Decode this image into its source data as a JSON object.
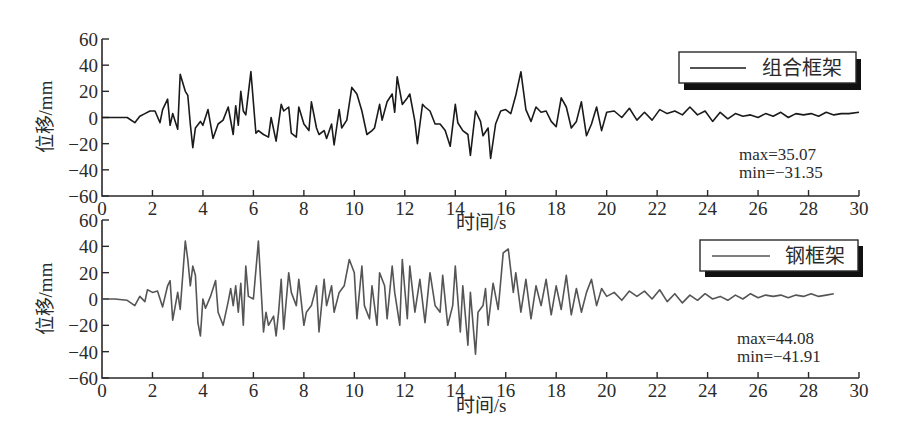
{
  "chart_data": [
    {
      "type": "line",
      "title": "",
      "xlabel": "时间/s",
      "ylabel": "位移/mm",
      "xlim": [
        0,
        30
      ],
      "ylim": [
        -60,
        60
      ],
      "xticks": [
        0,
        2,
        4,
        6,
        8,
        10,
        12,
        14,
        16,
        18,
        20,
        22,
        24,
        26,
        28,
        30
      ],
      "yticks": [
        -60,
        -40,
        -20,
        0,
        20,
        40,
        60
      ],
      "grid": false,
      "legend": {
        "position": "upper right",
        "entries": [
          "组合框架"
        ]
      },
      "color": "#1a1a1a",
      "annotations": [
        "max=35.07",
        "min=-31.35"
      ],
      "series": [
        {
          "name": "组合框架",
          "x": [
            0,
            0.5,
            1.0,
            1.3,
            1.5,
            1.7,
            1.9,
            2.1,
            2.3,
            2.4,
            2.6,
            2.7,
            2.8,
            3.0,
            3.1,
            3.3,
            3.4,
            3.5,
            3.6,
            3.7,
            3.9,
            4.0,
            4.2,
            4.4,
            4.6,
            4.8,
            5.0,
            5.2,
            5.3,
            5.4,
            5.5,
            5.6,
            5.7,
            5.9,
            6.1,
            6.2,
            6.4,
            6.6,
            6.7,
            6.9,
            7.1,
            7.2,
            7.4,
            7.5,
            7.7,
            7.8,
            8.0,
            8.2,
            8.3,
            8.5,
            8.6,
            8.8,
            8.9,
            9.1,
            9.2,
            9.4,
            9.5,
            9.7,
            9.9,
            10.1,
            10.3,
            10.5,
            10.7,
            10.8,
            11.0,
            11.1,
            11.3,
            11.5,
            11.6,
            11.7,
            11.9,
            12.1,
            12.2,
            12.4,
            12.5,
            12.7,
            12.8,
            13.0,
            13.2,
            13.4,
            13.6,
            13.8,
            14.0,
            14.1,
            14.3,
            14.5,
            14.6,
            14.8,
            15.0,
            15.1,
            15.3,
            15.4,
            15.6,
            15.8,
            16.0,
            16.2,
            16.4,
            16.6,
            16.8,
            17.0,
            17.2,
            17.4,
            17.6,
            17.8,
            18.0,
            18.2,
            18.4,
            18.6,
            18.8,
            19.0,
            19.2,
            19.4,
            19.6,
            19.8,
            20.0,
            20.3,
            20.6,
            20.9,
            21.2,
            21.5,
            21.8,
            22.1,
            22.4,
            22.7,
            23.0,
            23.3,
            23.6,
            23.9,
            24.2,
            24.5,
            24.8,
            25.1,
            25.4,
            25.7,
            26.0,
            26.3,
            26.6,
            26.9,
            27.2,
            27.5,
            27.8,
            28.1,
            28.4,
            28.7,
            29.0,
            29.3,
            29.6,
            30.0
          ],
          "y": [
            0,
            0,
            0,
            -4,
            1,
            3,
            5,
            5,
            -4,
            6,
            14,
            -6,
            3,
            -9,
            33,
            20,
            17,
            -5,
            -23,
            -8,
            -3,
            -6,
            6,
            -16,
            -5,
            -2,
            8,
            -13,
            9,
            -6,
            20,
            5,
            2,
            35.07,
            -12,
            -10,
            -13,
            -15,
            0,
            -18,
            10,
            5,
            8,
            -12,
            -15,
            8,
            -5,
            -10,
            12,
            -8,
            -13,
            -10,
            -16,
            -5,
            -21,
            6,
            -8,
            -2,
            23,
            18,
            5,
            -13,
            -10,
            -8,
            10,
            -2,
            12,
            18,
            4,
            31,
            10,
            15,
            18,
            -3,
            -20,
            10,
            8,
            5,
            -5,
            -5,
            -10,
            -22,
            10,
            -4,
            -10,
            -13,
            -29,
            5,
            -3,
            -14,
            -8,
            -31.35,
            -5,
            5,
            6,
            3,
            17,
            35,
            6,
            -3,
            8,
            4,
            5,
            -3,
            -7,
            15,
            8,
            -8,
            -3,
            12,
            -14,
            -5,
            8,
            -10,
            4,
            5,
            0,
            7,
            -2,
            4,
            -2,
            6,
            3,
            5,
            2,
            8,
            2,
            5,
            -3,
            4,
            -1,
            3,
            1,
            2,
            0,
            3,
            1,
            4,
            0,
            3,
            2,
            3,
            1,
            4,
            2,
            3,
            3,
            4,
            3,
            4
          ]
        }
      ]
    },
    {
      "type": "line",
      "title": "",
      "xlabel": "时间/s",
      "ylabel": "位移/mm",
      "xlim": [
        0,
        30
      ],
      "ylim": [
        -60,
        60
      ],
      "xticks": [
        0,
        2,
        4,
        6,
        8,
        10,
        12,
        14,
        16,
        18,
        20,
        22,
        24,
        26,
        28,
        30
      ],
      "yticks": [
        -60,
        -40,
        -20,
        0,
        20,
        40,
        60
      ],
      "grid": false,
      "legend": {
        "position": "upper right",
        "entries": [
          "钢框架"
        ]
      },
      "color": "#555555",
      "annotations": [
        "max=44.08",
        "min=-41.91"
      ],
      "series": [
        {
          "name": "钢框架",
          "x": [
            0,
            0.5,
            1.0,
            1.3,
            1.5,
            1.7,
            1.8,
            2.0,
            2.2,
            2.4,
            2.6,
            2.7,
            2.8,
            3.0,
            3.1,
            3.3,
            3.4,
            3.5,
            3.6,
            3.7,
            3.8,
            3.9,
            4.0,
            4.1,
            4.3,
            4.5,
            4.6,
            4.8,
            5.0,
            5.1,
            5.2,
            5.3,
            5.4,
            5.5,
            5.6,
            5.7,
            5.8,
            6.0,
            6.2,
            6.4,
            6.5,
            6.6,
            6.8,
            6.9,
            7.0,
            7.1,
            7.2,
            7.4,
            7.5,
            7.7,
            7.8,
            8.0,
            8.1,
            8.3,
            8.5,
            8.6,
            8.8,
            8.9,
            9.1,
            9.2,
            9.4,
            9.6,
            9.8,
            10.0,
            10.1,
            10.3,
            10.4,
            10.6,
            10.7,
            10.9,
            11.0,
            11.2,
            11.3,
            11.5,
            11.6,
            11.8,
            11.9,
            12.1,
            12.2,
            12.4,
            12.6,
            12.8,
            13.0,
            13.2,
            13.4,
            13.5,
            13.7,
            13.9,
            14.0,
            14.2,
            14.3,
            14.5,
            14.6,
            14.8,
            14.9,
            15.1,
            15.2,
            15.3,
            15.5,
            15.7,
            15.9,
            16.1,
            16.3,
            16.4,
            16.6,
            16.8,
            17.0,
            17.2,
            17.4,
            17.6,
            17.8,
            18.0,
            18.2,
            18.4,
            18.6,
            18.8,
            19.0,
            19.2,
            19.4,
            19.6,
            19.8,
            20.0,
            20.3,
            20.6,
            20.9,
            21.2,
            21.5,
            21.8,
            22.1,
            22.4,
            22.7,
            23.0,
            23.3,
            23.6,
            23.9,
            24.2,
            24.5,
            24.8,
            25.1,
            25.4,
            25.7,
            26.0,
            26.3,
            26.6,
            26.9,
            27.2,
            27.5,
            27.8,
            28.1,
            28.4,
            28.7,
            29.0,
            29.3,
            29.6,
            30.0
          ],
          "y": [
            0,
            0,
            -1,
            -5,
            2,
            -2,
            7,
            5,
            6,
            -6,
            10,
            14,
            -16,
            5,
            -8,
            44.08,
            30,
            10,
            25,
            18,
            -18,
            -28,
            0,
            -7,
            2,
            14,
            -10,
            -20,
            -2,
            8,
            -5,
            10,
            -10,
            12,
            -20,
            25,
            2,
            0,
            44,
            -25,
            -10,
            -20,
            -13,
            -28,
            -10,
            15,
            -23,
            20,
            5,
            -5,
            15,
            -20,
            -10,
            -5,
            10,
            -25,
            15,
            -5,
            10,
            -10,
            5,
            10,
            30,
            20,
            -15,
            25,
            -5,
            -15,
            10,
            -20,
            20,
            10,
            -15,
            25,
            5,
            -20,
            30,
            -15,
            25,
            -10,
            15,
            -18,
            20,
            -5,
            -10,
            18,
            -20,
            -5,
            25,
            -25,
            10,
            -35,
            5,
            -41.91,
            -10,
            -5,
            8,
            -20,
            12,
            -8,
            35,
            38,
            5,
            20,
            -10,
            15,
            -15,
            10,
            -5,
            15,
            -12,
            10,
            -8,
            18,
            -12,
            8,
            -10,
            5,
            15,
            -5,
            8,
            2,
            5,
            -1,
            6,
            2,
            6,
            0,
            7,
            -2,
            4,
            -3,
            3,
            -1,
            4,
            0,
            2,
            -1,
            3,
            0,
            4,
            1,
            3,
            2,
            3,
            1,
            3,
            2,
            4,
            2,
            3,
            4
          ]
        }
      ]
    }
  ],
  "panels": [
    {
      "legend_label": "组合框架",
      "max_text": "max=35.07",
      "min_text": "min=−31.35",
      "ylabel": "位移/mm",
      "xlabel": "时间/s",
      "ytick_labels": [
        "60",
        "40",
        "20",
        "0",
        "−20",
        "−40",
        "−60"
      ],
      "xtick_labels": [
        "0",
        "2",
        "4",
        "6",
        "8",
        "10",
        "12",
        "14",
        "16",
        "18",
        "20",
        "22",
        "24",
        "26",
        "28",
        "30"
      ]
    },
    {
      "legend_label": "钢框架",
      "max_text": "max=44.08",
      "min_text": "min=−41.91",
      "ylabel": "位移/mm",
      "xlabel": "时间/s",
      "ytick_labels": [
        "60",
        "40",
        "20",
        "0",
        "−20",
        "−40",
        "−60"
      ],
      "xtick_labels": [
        "0",
        "2",
        "4",
        "6",
        "8",
        "10",
        "12",
        "14",
        "16",
        "18",
        "20",
        "22",
        "24",
        "26",
        "28",
        "30"
      ]
    }
  ],
  "colors": {
    "axis": "#2a2a2a",
    "composite_frame_line": "#1a1a1a",
    "steel_frame_line": "#555555",
    "legend_shadow": "#111111"
  }
}
